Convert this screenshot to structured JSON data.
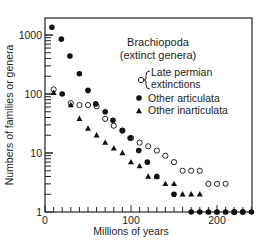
{
  "chart_data": {
    "type": "scatter",
    "title": "Brachiopoda",
    "subtitle": "(extinct genera)",
    "xlabel": "Millions of years",
    "ylabel": "Numbers of families or genera",
    "xlim": [
      0,
      240
    ],
    "ylim": [
      1,
      2000
    ],
    "yscale": "log",
    "x_ticks": [
      0,
      100,
      200
    ],
    "x_minor_step": 10,
    "y_ticks": [
      1,
      10,
      100,
      1000
    ],
    "grid": false,
    "legend_position": "upper right",
    "legend_bracket_label": [
      "Late permian",
      "extinctions"
    ],
    "series": [
      {
        "name": "Late permian extinctions",
        "marker": "open-circle",
        "points": [
          [
            10,
            120
          ],
          [
            30,
            70
          ],
          [
            40,
            65
          ],
          [
            50,
            65
          ],
          [
            60,
            62
          ],
          [
            70,
            38
          ],
          [
            80,
            29
          ],
          [
            90,
            24
          ],
          [
            100,
            18
          ],
          [
            110,
            15
          ],
          [
            120,
            13
          ],
          [
            130,
            11
          ],
          [
            140,
            9
          ],
          [
            150,
            7
          ],
          [
            160,
            5
          ],
          [
            170,
            5
          ],
          [
            180,
            5
          ],
          [
            190,
            3
          ],
          [
            200,
            3
          ],
          [
            210,
            3
          ],
          [
            220,
            1
          ],
          [
            230,
            1
          ]
        ]
      },
      {
        "name": "Other articulata",
        "marker": "filled-circle",
        "points": [
          [
            8,
            1350
          ],
          [
            19,
            850
          ],
          [
            29,
            440
          ],
          [
            40,
            220
          ],
          [
            50,
            115
          ],
          [
            20,
            100
          ],
          [
            59,
            68
          ],
          [
            70,
            50
          ],
          [
            79,
            36
          ],
          [
            90,
            24
          ],
          [
            99,
            18
          ],
          [
            109,
            11
          ],
          [
            119,
            7
          ],
          [
            130,
            4
          ],
          [
            150,
            2
          ],
          [
            170,
            1
          ],
          [
            180,
            1
          ],
          [
            190,
            1
          ],
          [
            200,
            1
          ],
          [
            210,
            1
          ],
          [
            220,
            1
          ],
          [
            230,
            1
          ],
          [
            240,
            1
          ],
          [
            250,
            1
          ],
          [
            260,
            1
          ]
        ]
      },
      {
        "name": "Other inarticulata",
        "marker": "filled-triangle",
        "points": [
          [
            10,
            105
          ],
          [
            30,
            65
          ],
          [
            40,
            38
          ],
          [
            50,
            26
          ],
          [
            60,
            20
          ],
          [
            70,
            15
          ],
          [
            80,
            12
          ],
          [
            90,
            10
          ],
          [
            100,
            7
          ],
          [
            110,
            6
          ],
          [
            120,
            4
          ],
          [
            130,
            4
          ],
          [
            140,
            3
          ],
          [
            150,
            3
          ],
          [
            160,
            2
          ],
          [
            170,
            2
          ],
          [
            180,
            2
          ],
          [
            190,
            1
          ],
          [
            200,
            1
          ],
          [
            210,
            1
          ],
          [
            220,
            1
          ]
        ]
      }
    ]
  }
}
